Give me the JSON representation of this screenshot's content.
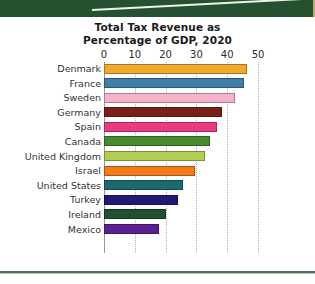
{
  "page": {
    "top_band_color": "#26512f",
    "accent_edge_color": "#b9a96b",
    "bottom_rule_color": "#4f7355"
  },
  "chart_data": {
    "type": "bar",
    "orientation": "horizontal",
    "title": "Total Tax Revenue as Percentage of GDP, 2020",
    "title_line_1": "Total Tax Revenue as",
    "title_line_2": "Percentage of GDP, 2020",
    "xlabel": "",
    "ylabel": "",
    "xlim": [
      0,
      50
    ],
    "xticks": [
      0,
      10,
      20,
      30,
      40,
      50
    ],
    "xtick_labels": [
      "0",
      "10",
      "20",
      "30",
      "40",
      "50"
    ],
    "grid": true,
    "grid_axis": "x",
    "legend": false,
    "categories": [
      "Denmark",
      "France",
      "Sweden",
      "Germany",
      "Spain",
      "Canada",
      "United Kingdom",
      "Israel",
      "United States",
      "Turkey",
      "Ireland",
      "Mexico"
    ],
    "values": [
      46.5,
      45.4,
      42.6,
      38.3,
      36.6,
      34.4,
      32.8,
      29.7,
      25.5,
      23.9,
      20.2,
      17.9
    ],
    "colors": [
      "#f0aa2c",
      "#3d7fa6",
      "#f5b3ca",
      "#7c1f18",
      "#eb3a7f",
      "#4a8a2f",
      "#b5cc52",
      "#f47a1b",
      "#1a6b6b",
      "#201a76",
      "#1f5131",
      "#5b2191"
    ],
    "bars": [
      {
        "label": "Denmark",
        "value": 46.5,
        "color": "#f0aa2c"
      },
      {
        "label": "France",
        "value": 45.4,
        "color": "#3d7fa6"
      },
      {
        "label": "Sweden",
        "value": 42.6,
        "color": "#f5b3ca"
      },
      {
        "label": "Germany",
        "value": 38.3,
        "color": "#7c1f18"
      },
      {
        "label": "Spain",
        "value": 36.6,
        "color": "#eb3a7f"
      },
      {
        "label": "Canada",
        "value": 34.4,
        "color": "#4a8a2f"
      },
      {
        "label": "United Kingdom",
        "value": 32.8,
        "color": "#b5cc52"
      },
      {
        "label": "Israel",
        "value": 29.7,
        "color": "#f47a1b"
      },
      {
        "label": "United States",
        "value": 25.5,
        "color": "#1a6b6b"
      },
      {
        "label": "Turkey",
        "value": 23.9,
        "color": "#201a76"
      },
      {
        "label": "Ireland",
        "value": 20.2,
        "color": "#1f5131"
      },
      {
        "label": "Mexico",
        "value": 17.9,
        "color": "#5b2191"
      }
    ]
  }
}
